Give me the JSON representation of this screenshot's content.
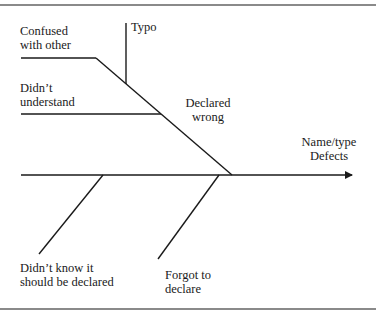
{
  "diagram": {
    "type": "fishbone",
    "effect": {
      "line1": "Name/type",
      "line2": "Defects"
    },
    "causes": [
      {
        "id": "confused-with-other",
        "line1": "Confused",
        "line2": "with other",
        "position": "upper"
      },
      {
        "id": "typo",
        "line1": "Typo",
        "position": "upper-sub"
      },
      {
        "id": "didnt-understand",
        "line1": "Didn’t",
        "line2": "understand",
        "position": "upper"
      },
      {
        "id": "declared-wrong",
        "line1": "Declared",
        "line2": "wrong",
        "position": "upper-main"
      },
      {
        "id": "didnt-know-should-be-declared",
        "line1": "Didn’t know it",
        "line2": "should be declared",
        "position": "lower"
      },
      {
        "id": "forgot-to-declare",
        "line1": "Forgot to",
        "line2": "declare",
        "position": "lower"
      }
    ],
    "colors": {
      "line": "#1a1a1a",
      "rule": "#8a8a8a",
      "background": "#ffffff"
    }
  }
}
